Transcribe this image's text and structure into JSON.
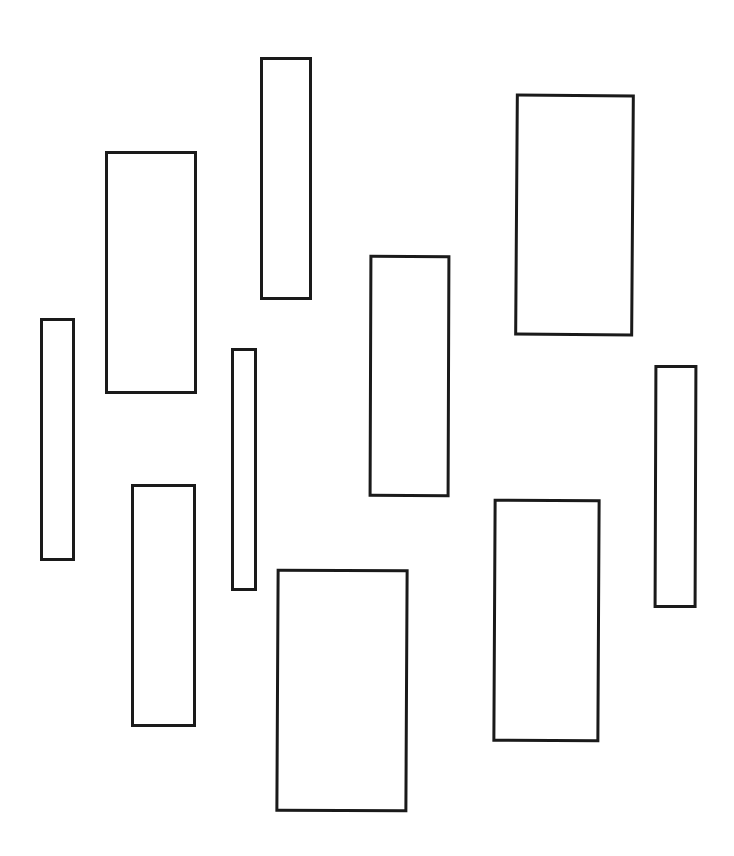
{
  "canvas": {
    "width": 734,
    "height": 856,
    "background": "#ffffff"
  },
  "style": {
    "stroke_color": "#1a1a1a",
    "stroke_width": 3,
    "fill": "none"
  },
  "shapes": [
    {
      "id": "rect-1",
      "type": "rectangle",
      "x": 40,
      "y": 318,
      "width": 35,
      "height": 243,
      "rotation": 0
    },
    {
      "id": "rect-2",
      "type": "rectangle",
      "x": 105,
      "y": 151,
      "width": 92,
      "height": 243,
      "rotation": 0
    },
    {
      "id": "rect-3",
      "type": "rectangle",
      "x": 131,
      "y": 484,
      "width": 65,
      "height": 243,
      "rotation": 0
    },
    {
      "id": "rect-4",
      "type": "rectangle",
      "x": 231,
      "y": 348,
      "width": 26,
      "height": 243,
      "rotation": 0
    },
    {
      "id": "rect-5",
      "type": "rectangle",
      "x": 260,
      "y": 57,
      "width": 52,
      "height": 243,
      "rotation": 0
    },
    {
      "id": "rect-6",
      "type": "rectangle",
      "x": 276,
      "y": 569,
      "width": 132,
      "height": 243,
      "rotation": 0.3
    },
    {
      "id": "rect-7",
      "type": "rectangle",
      "x": 369,
      "y": 255,
      "width": 81,
      "height": 242,
      "rotation": 0.2
    },
    {
      "id": "rect-8",
      "type": "rectangle",
      "x": 493,
      "y": 499,
      "width": 107,
      "height": 243,
      "rotation": 0.3
    },
    {
      "id": "rect-9",
      "type": "rectangle",
      "x": 515,
      "y": 94,
      "width": 119,
      "height": 242,
      "rotation": 0.4
    },
    {
      "id": "rect-10",
      "type": "rectangle",
      "x": 654,
      "y": 365,
      "width": 43,
      "height": 243,
      "rotation": 0.2
    }
  ]
}
